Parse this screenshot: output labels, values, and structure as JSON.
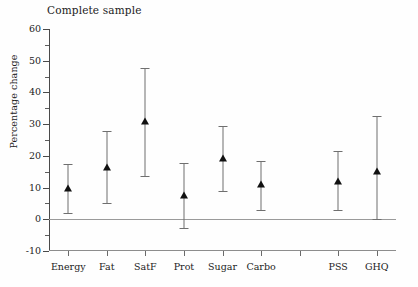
{
  "chart_data": {
    "type": "scatter",
    "title": "Complete sample",
    "xlabel": "",
    "ylabel": "Percentage change",
    "ylim": [
      -10,
      60
    ],
    "ytick_values": [
      -10,
      0,
      10,
      20,
      30,
      40,
      50,
      60
    ],
    "ytick_labels": [
      "-10",
      "0",
      "10",
      "20",
      "30",
      "40",
      "50",
      "60"
    ],
    "yminor_values": [
      -5,
      5,
      15,
      25,
      35,
      45,
      55
    ],
    "grid": false,
    "legend": "none",
    "zero_reference_line": 0,
    "categories": [
      "Energy",
      "Fat",
      "SatF",
      "Prot",
      "Sugar",
      "Carbo",
      "",
      "PSS",
      "GHQ"
    ],
    "tick_labels": [
      "Energy",
      "Fat",
      "SatF",
      "Prot",
      "Sugar",
      "Carbo",
      "",
      "PSS",
      "GHQ"
    ],
    "values": [
      10.0,
      16.5,
      31.0,
      7.8,
      19.2,
      11.0,
      null,
      12.2,
      15.3
    ],
    "ci_lower": [
      2.0,
      5.0,
      13.5,
      -2.8,
      9.0,
      3.0,
      null,
      3.0,
      0.0
    ],
    "ci_upper": [
      17.5,
      27.7,
      47.8,
      17.6,
      29.5,
      18.5,
      null,
      21.4,
      32.5
    ],
    "points": [
      {
        "label": "Energy",
        "value": 10.0,
        "ci_lower": 2.0,
        "ci_upper": 17.5
      },
      {
        "label": "Fat",
        "value": 16.5,
        "ci_lower": 5.0,
        "ci_upper": 27.7
      },
      {
        "label": "SatF",
        "value": 31.0,
        "ci_lower": 13.5,
        "ci_upper": 47.8
      },
      {
        "label": "Prot",
        "value": 7.8,
        "ci_lower": -2.8,
        "ci_upper": 17.6
      },
      {
        "label": "Sugar",
        "value": 19.2,
        "ci_lower": 9.0,
        "ci_upper": 29.5
      },
      {
        "label": "Carbo",
        "value": 11.0,
        "ci_lower": 3.0,
        "ci_upper": 18.5
      },
      {
        "label": "",
        "value": null,
        "ci_lower": null,
        "ci_upper": null
      },
      {
        "label": "PSS",
        "value": 12.2,
        "ci_lower": 3.0,
        "ci_upper": 21.4
      },
      {
        "label": "GHQ",
        "value": 15.3,
        "ci_lower": 0.0,
        "ci_upper": 32.5
      }
    ],
    "marker_color": "#111111",
    "whisker_color": "#6f6f6f",
    "axis_color": "#4a4a4a",
    "zero_line_color": "#9a9a9a"
  }
}
